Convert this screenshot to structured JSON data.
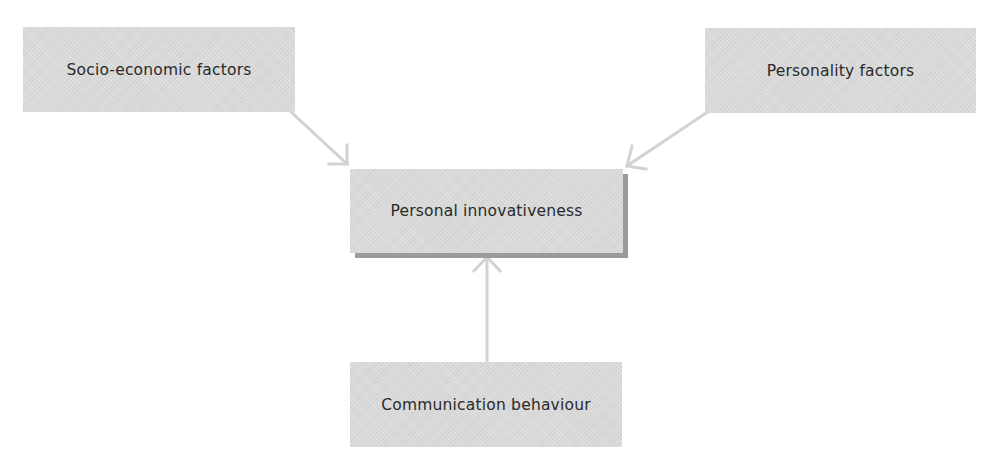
{
  "diagram": {
    "nodes": [
      {
        "id": "socio",
        "label": "Socio-economic factors",
        "x": 23,
        "y": 27,
        "w": 272,
        "h": 85
      },
      {
        "id": "personality",
        "label": "Personality factors",
        "x": 705,
        "y": 28,
        "w": 271,
        "h": 85
      },
      {
        "id": "innovativeness",
        "label": "Personal innovativeness",
        "x": 350,
        "y": 169,
        "w": 273,
        "h": 84
      },
      {
        "id": "communication",
        "label": "Communication behaviour",
        "x": 350,
        "y": 362,
        "w": 272,
        "h": 85
      }
    ],
    "edges": [
      {
        "from": "socio",
        "to": "innovativeness"
      },
      {
        "from": "personality",
        "to": "innovativeness"
      },
      {
        "from": "communication",
        "to": "innovativeness"
      }
    ],
    "colors": {
      "box_fill": "#d9d9d9",
      "box_shadow": "#9b9b9b",
      "arrow": "#d4d4d4",
      "text": "#2a2a2a"
    }
  }
}
